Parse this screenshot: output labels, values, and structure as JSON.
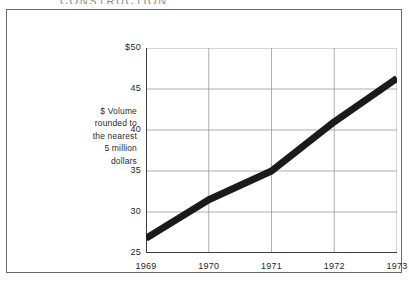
{
  "cropped_title": "CONSTRUCTION",
  "axis_note": {
    "lines": [
      "$ Volume",
      "rounded to",
      "the nearest",
      "5 million",
      "dollars"
    ]
  },
  "chart_data": {
    "type": "line",
    "title": "",
    "subtitle": "",
    "xlabel": "",
    "ylabel": "$ Volume rounded to the nearest 5 million dollars",
    "categories": [
      "1969",
      "1970",
      "1971",
      "1972",
      "1973"
    ],
    "x": [
      1969,
      1970,
      1971,
      1972,
      1973
    ],
    "series": [
      {
        "name": "Construction $ volume",
        "values": [
          26.8,
          31.5,
          35.0,
          41.0,
          46.3
        ]
      }
    ],
    "y_tick_labels": [
      "$50",
      "45",
      "40",
      "35",
      "30",
      "25"
    ],
    "y_tick_values": [
      50,
      45,
      40,
      35,
      30,
      25
    ],
    "x_tick_labels": [
      "1969",
      "1970",
      "1971",
      "1972",
      "1973"
    ],
    "ylim": [
      25,
      50
    ],
    "xlim": [
      1969,
      1973
    ],
    "grid": true,
    "legend": "none",
    "line_color": "#1a1a1a",
    "line_width_px": 7,
    "grid_color": "#9a9a9a",
    "axis_color": "#3d3d3d",
    "frame_color": "#6a6a6a",
    "background": "#ffffff"
  }
}
